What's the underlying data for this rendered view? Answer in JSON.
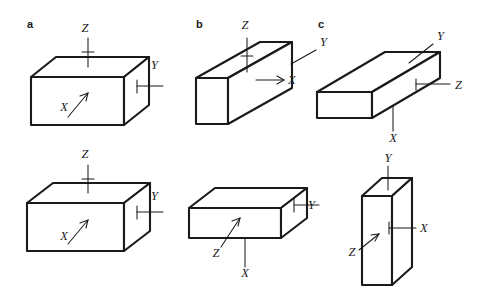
{
  "figure": {
    "background_color": "#ffffff",
    "line_color": "#1a1a1a",
    "panels": [
      {
        "id": "a",
        "letter": "a",
        "letter_x": 27,
        "letter_y": 28,
        "shapes": [
          {
            "name": "block-a-top",
            "description": "wide rectangular block, Z up, Y right, X front face",
            "labels": [
              {
                "text": "Z",
                "x": 85,
                "y": 32
              },
              {
                "text": "Y",
                "x": 151,
                "y": 69
              },
              {
                "text": "X",
                "x": 64,
                "y": 111
              }
            ]
          },
          {
            "name": "block-a-bottom",
            "description": "wide rectangular block, Z up, Y right, X front face",
            "labels": [
              {
                "text": "Z",
                "x": 85,
                "y": 158
              },
              {
                "text": "Y",
                "x": 151,
                "y": 200
              },
              {
                "text": "X",
                "x": 64,
                "y": 240
              }
            ]
          }
        ]
      },
      {
        "id": "b",
        "letter": "b",
        "letter_x": 196,
        "letter_y": 28,
        "shapes": [
          {
            "name": "block-b-top",
            "description": "long bar receding to upper right, Z up, Y upper right, X into right face",
            "labels": [
              {
                "text": "Z",
                "x": 245,
                "y": 29
              },
              {
                "text": "Y",
                "x": 320,
                "y": 46
              },
              {
                "text": "X",
                "x": 288,
                "y": 83
              }
            ]
          },
          {
            "name": "block-b-bottom",
            "description": "flat slab, Y right, Z front-left, X below",
            "labels": [
              {
                "text": "Y",
                "x": 308,
                "y": 209
              },
              {
                "text": "Z",
                "x": 216,
                "y": 256
              },
              {
                "text": "X",
                "x": 245,
                "y": 277
              }
            ]
          }
        ]
      },
      {
        "id": "c",
        "letter": "c",
        "letter_x": 318,
        "letter_y": 28,
        "shapes": [
          {
            "name": "block-c-top",
            "description": "long flat bar receding to upper right, Y upper right, Z right, X below",
            "labels": [
              {
                "text": "Y",
                "x": 438,
                "y": 35
              },
              {
                "text": "Z",
                "x": 458,
                "y": 88
              },
              {
                "text": "X",
                "x": 396,
                "y": 140
              }
            ]
          },
          {
            "name": "block-c-bottom",
            "description": "tall thin vertical slab, Y up, X right, Z lower left",
            "labels": [
              {
                "text": "Y",
                "x": 386,
                "y": 160
              },
              {
                "text": "X",
                "x": 424,
                "y": 231
              },
              {
                "text": "Z",
                "x": 352,
                "y": 254
              }
            ]
          }
        ]
      }
    ]
  }
}
